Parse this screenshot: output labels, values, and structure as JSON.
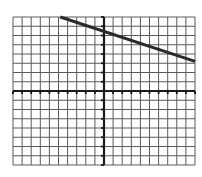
{
  "chart_data": {
    "type": "line",
    "title": "",
    "xlabel": "",
    "ylabel": "",
    "grid": true,
    "xlim": [
      -10,
      10
    ],
    "ylim": [
      -8,
      8
    ],
    "tick_step": 1,
    "series": [
      {
        "name": "line",
        "x": [
          -4.8,
          10
        ],
        "y": [
          8,
          3.2
        ],
        "slope": -0.33,
        "intercept": 6.4
      }
    ],
    "legend": null
  },
  "colors": {
    "grid": "#5a5a5a",
    "axis": "#1a1a1a",
    "line": "#2a2a2a",
    "background": "#ffffff"
  },
  "layout": {
    "left": 13,
    "right": 195,
    "top": 17,
    "bottom": 165
  }
}
